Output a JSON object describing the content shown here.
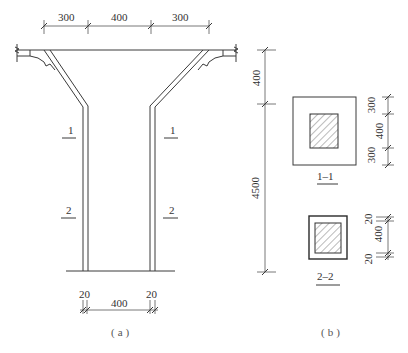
{
  "figure_a": {
    "caption": "(a)",
    "top_dims": [
      "300",
      "400",
      "300"
    ],
    "bottom_dims": {
      "left": "20",
      "middle": "400",
      "right": "20"
    },
    "section_marks": {
      "left_1": "1",
      "right_1": "1",
      "left_2": "2",
      "right_2": "2"
    }
  },
  "figure_b": {
    "caption": "(b)",
    "vertical_dims": {
      "top": "400",
      "main": "4500"
    },
    "section_1": {
      "label": "1–1",
      "dims": [
        "300",
        "400",
        "300"
      ]
    },
    "section_2": {
      "label": "2–2",
      "dims": [
        "20",
        "400",
        "20"
      ]
    }
  }
}
